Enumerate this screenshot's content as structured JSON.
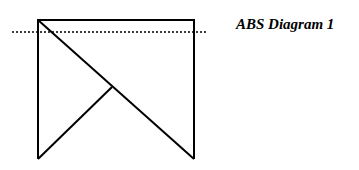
{
  "title": "ABS Diagram 1",
  "colors": {
    "stroke": "#000000",
    "background": "#ffffff"
  },
  "shape": {
    "outline_points": [
      [
        38,
        159
      ],
      [
        38,
        20
      ],
      [
        194,
        20
      ],
      [
        194,
        159
      ]
    ],
    "diagonal": [
      [
        38,
        20
      ],
      [
        194,
        159
      ]
    ],
    "inner_branch": [
      [
        112,
        87
      ],
      [
        38,
        159
      ]
    ]
  },
  "reference_line": {
    "style": "dotted",
    "y": 32,
    "x1": 12,
    "x2": 207
  }
}
